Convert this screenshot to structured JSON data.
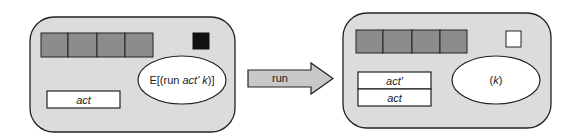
{
  "before_state": {
    "register_cells": 4,
    "flag_color": "#111111",
    "expression": {
      "prefix": "E[(run ",
      "arg1": "act'",
      "space": " ",
      "arg2": "k",
      "suffix": ")]"
    },
    "stack": [
      "act"
    ]
  },
  "transition": {
    "label": "run"
  },
  "after_state": {
    "register_cells": 4,
    "flag_color": "#ffffff",
    "expression": {
      "open": "(",
      "arg": "k",
      "close": ")"
    },
    "stack": [
      "act'",
      "act"
    ]
  },
  "colors": {
    "panel_fill": "#dcdcdc",
    "register_fill": "#8c8c8c",
    "arrow_fill": "#c8c8c8",
    "stroke": "#222222"
  }
}
